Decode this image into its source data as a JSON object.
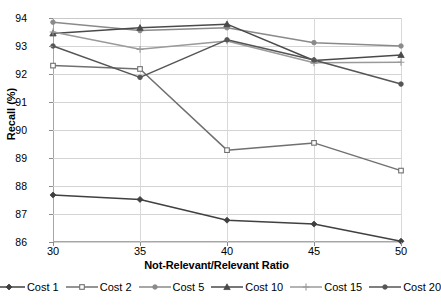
{
  "chart_data": {
    "type": "line",
    "title": "",
    "xlabel": "Not-Relevant/Relevant Ratio",
    "ylabel": "Recall (%)",
    "categories": [
      "30",
      "35",
      "40",
      "45",
      "50"
    ],
    "x": [
      30,
      35,
      40,
      45,
      50
    ],
    "ylim": [
      86,
      94
    ],
    "yticks": [
      "86",
      "87",
      "88",
      "89",
      "90",
      "91",
      "92",
      "93",
      "94"
    ],
    "ytick_step": 1,
    "xlim": [
      30,
      50
    ],
    "grid": "horizontal",
    "legend_position": "bottom",
    "series": [
      {
        "name": "Cost 1",
        "marker": "diamond",
        "color": "#404040",
        "values": [
          87.68,
          87.52,
          86.78,
          86.64,
          86.03
        ]
      },
      {
        "name": "Cost 2",
        "marker": "square",
        "color": "#707070",
        "values": [
          92.3,
          92.18,
          89.28,
          89.54,
          88.55
        ]
      },
      {
        "name": "Cost 5",
        "marker": "circle",
        "color": "#8a8a8a",
        "values": [
          93.85,
          93.55,
          93.65,
          93.12,
          93.0
        ]
      },
      {
        "name": "Cost 10",
        "marker": "triangle",
        "color": "#4a4a4a",
        "values": [
          93.45,
          93.65,
          93.78,
          92.48,
          92.68
        ]
      },
      {
        "name": "Cost 15",
        "marker": "plus",
        "color": "#9a9a9a",
        "values": [
          93.5,
          92.88,
          93.18,
          92.4,
          92.42
        ]
      },
      {
        "name": "Cost 20",
        "marker": "circle",
        "color": "#555555",
        "values": [
          93.0,
          91.88,
          93.22,
          92.5,
          91.64
        ]
      }
    ]
  },
  "axis": {
    "x_title": "Not-Relevant/Relevant Ratio",
    "y_title": "Recall (%)"
  },
  "legend": {
    "items": [
      {
        "label": "Cost 1"
      },
      {
        "label": "Cost 2"
      },
      {
        "label": "Cost 5"
      },
      {
        "label": "Cost 10"
      },
      {
        "label": "Cost 15"
      },
      {
        "label": "Cost 20"
      }
    ]
  }
}
